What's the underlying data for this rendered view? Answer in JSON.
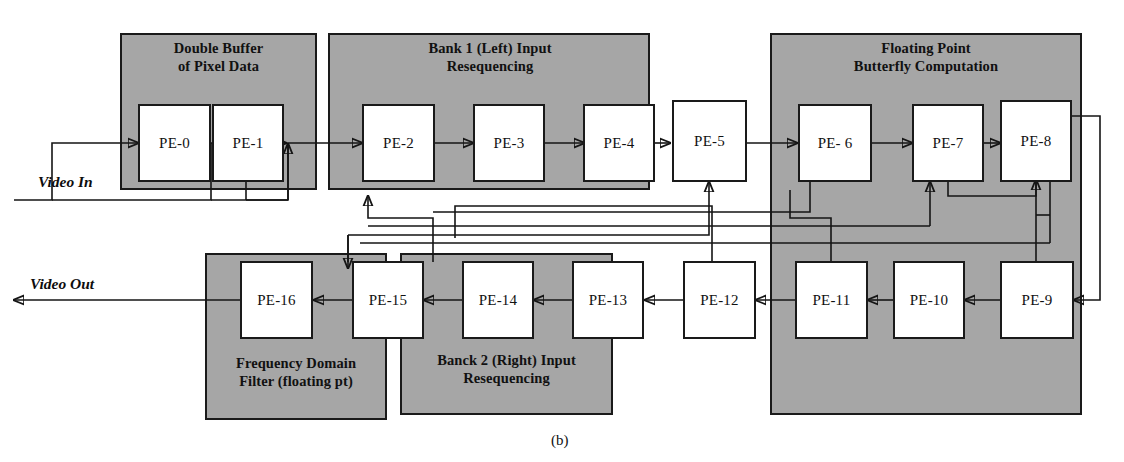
{
  "figure": {
    "caption": "(b)",
    "background_color": "#ffffff",
    "group_fill_color": "#a6a6a6",
    "box_fill_color": "#ffffff",
    "line_color": "#151515"
  },
  "io": {
    "input_label": "Video In",
    "output_label": "Video Out"
  },
  "groups": [
    {
      "id": "double-buffer",
      "label": "Double Buffer\nof Pixel Data"
    },
    {
      "id": "bank1-resequencing",
      "label": "Bank 1 (Left) Input\nResequencing"
    },
    {
      "id": "butterfly-computation",
      "label": "Floating Point\nButterfly Computation"
    },
    {
      "id": "frequency-filter",
      "label": "Frequency Domain\nFilter (floating pt)"
    },
    {
      "id": "bank2-resequencing",
      "label": "Banck 2 (Right) Input\nResequencing"
    }
  ],
  "processing_elements": [
    {
      "id": "pe-0",
      "label": "PE-0"
    },
    {
      "id": "pe-1",
      "label": "PE-1"
    },
    {
      "id": "pe-2",
      "label": "PE-2"
    },
    {
      "id": "pe-3",
      "label": "PE-3"
    },
    {
      "id": "pe-4",
      "label": "PE-4"
    },
    {
      "id": "pe-5",
      "label": "PE-5"
    },
    {
      "id": "pe-6",
      "label": "PE- 6"
    },
    {
      "id": "pe-7",
      "label": "PE-7"
    },
    {
      "id": "pe-8",
      "label": "PE-8"
    },
    {
      "id": "pe-9",
      "label": "PE-9"
    },
    {
      "id": "pe-10",
      "label": "PE-10"
    },
    {
      "id": "pe-11",
      "label": "PE-11"
    },
    {
      "id": "pe-12",
      "label": "PE-12"
    },
    {
      "id": "pe-13",
      "label": "PE-13"
    },
    {
      "id": "pe-14",
      "label": "PE-14"
    },
    {
      "id": "pe-15",
      "label": "PE-15"
    },
    {
      "id": "pe-16",
      "label": "PE-16"
    }
  ]
}
